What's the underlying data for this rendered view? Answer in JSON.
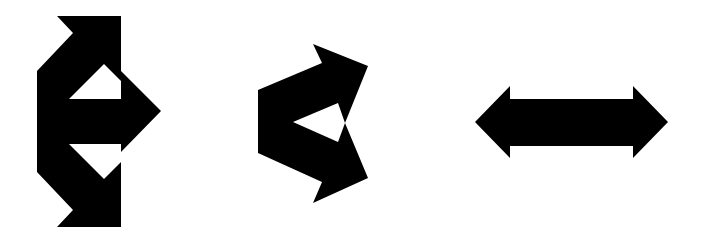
{
  "figure": {
    "description": "Three black geometric arrow figures on a white background",
    "background_color": "#ffffff",
    "fill_color": "#000000",
    "shapes": [
      {
        "id": "shape-1",
        "label": "Vertical bidirectional arrow with right-pointing arrowhead and two cut-out triangles",
        "points": "57,16 121,16 121,71 161,111 121,152 121,227 57,227 73,210 37,172 37,71 73,33",
        "holes": [
          "69,99 104,64 121,81 121,99",
          "69,144 121,144 121,162 104,179"
        ]
      },
      {
        "id": "shape-2",
        "label": "Angular chevron-like arrow pair pointing up-right and down-right with inner triangle cut-out",
        "points": "313,44 368,66 345,123 368,178 313,203 322,182 258,153 258,90 322,63",
        "holes": [
          "338,103 293,122 338,142 345,123"
        ]
      },
      {
        "id": "shape-3",
        "label": "Horizontal double-headed arrow",
        "points": "475,122 510,86 510,99 633,99 633,86 668,122 633,158 633,146 510,146 510,158"
      }
    ]
  }
}
